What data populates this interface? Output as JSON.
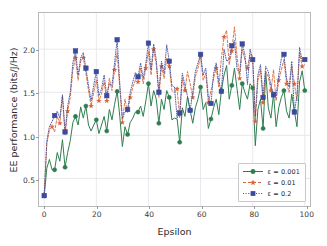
{
  "chart_data": {
    "type": "line",
    "title": "",
    "xlabel": "Epsilon",
    "ylabel": "EE performance (bits/J/Hz)",
    "xlim": [
      -2,
      102
    ],
    "ylim": [
      0.18,
      2.42
    ],
    "xticks": [
      0,
      20,
      40,
      60,
      80,
      100
    ],
    "yticks": [
      0.5,
      1.0,
      1.5,
      2.0
    ],
    "xticklabels": [
      "0",
      "20",
      "40",
      "60",
      "80",
      "100"
    ],
    "yticklabels": [
      "0.5",
      "1.0",
      "1.5",
      "2.0"
    ],
    "grid": true,
    "legend_position": "lower right",
    "x": [
      0,
      1,
      2,
      3,
      4,
      5,
      6,
      7,
      8,
      9,
      10,
      11,
      12,
      13,
      14,
      15,
      16,
      17,
      18,
      19,
      20,
      21,
      22,
      23,
      24,
      25,
      26,
      27,
      28,
      29,
      30,
      31,
      32,
      33,
      34,
      35,
      36,
      37,
      38,
      39,
      40,
      41,
      42,
      43,
      44,
      45,
      46,
      47,
      48,
      49,
      50,
      51,
      52,
      53,
      54,
      55,
      56,
      57,
      58,
      59,
      60,
      61,
      62,
      63,
      64,
      65,
      66,
      67,
      68,
      69,
      70,
      71,
      72,
      73,
      74,
      75,
      76,
      77,
      78,
      79,
      80,
      81,
      82,
      83,
      84,
      85,
      86,
      87,
      88,
      89,
      90,
      91,
      92,
      93,
      94,
      95,
      96,
      97,
      98,
      99,
      100
    ],
    "series": [
      {
        "name": "ε = 0.001",
        "color": "#2e7d4f",
        "linestyle": "solid",
        "marker": "circle",
        "marker_every": 4,
        "values": [
          0.3,
          0.62,
          0.72,
          0.6,
          0.6,
          0.8,
          0.7,
          0.95,
          0.63,
          0.8,
          0.94,
          1.15,
          1.22,
          1.12,
          1.33,
          1.2,
          1.34,
          1.12,
          1.05,
          1.12,
          1.18,
          1.02,
          1.12,
          1.22,
          1.05,
          1.3,
          1.18,
          1.36,
          1.51,
          1.22,
          0.87,
          1.1,
          1.01,
          1.15,
          1.2,
          1.27,
          1.27,
          1.34,
          1.22,
          1.4,
          1.6,
          1.34,
          1.52,
          1.42,
          1.14,
          1.42,
          1.3,
          1.52,
          1.44,
          1.18,
          1.2,
          1.19,
          0.92,
          1.32,
          1.22,
          1.45,
          1.29,
          1.14,
          1.32,
          1.42,
          1.56,
          1.3,
          1.38,
          1.08,
          1.19,
          1.32,
          1.42,
          1.24,
          1.52,
          1.7,
          1.81,
          1.42,
          1.58,
          1.78,
          1.54,
          1.3,
          1.6,
          1.5,
          1.42,
          1.6,
          1.55,
          0.88,
          1.3,
          1.42,
          1.08,
          1.74,
          1.32,
          1.2,
          1.48,
          1.1,
          1.32,
          1.44,
          1.52,
          1.28,
          1.2,
          1.48,
          1.28,
          1.1,
          1.62,
          1.75,
          1.52
        ]
      },
      {
        "name": "ε = 0.01",
        "color": "#d9663a",
        "linestyle": "dashed",
        "marker": "star",
        "marker_every": 3,
        "values": [
          0.32,
          0.9,
          1.06,
          1.1,
          1.04,
          1.22,
          1.14,
          1.46,
          1.0,
          1.28,
          1.44,
          1.76,
          1.9,
          1.64,
          1.86,
          1.9,
          1.72,
          1.52,
          1.34,
          1.5,
          1.64,
          1.4,
          1.48,
          1.62,
          1.4,
          1.66,
          1.52,
          1.76,
          1.96,
          1.54,
          1.15,
          1.42,
          1.26,
          1.44,
          1.56,
          1.64,
          1.62,
          1.78,
          1.6,
          1.78,
          1.97,
          1.7,
          2.0,
          1.82,
          1.44,
          1.8,
          1.66,
          1.9,
          1.8,
          1.52,
          1.5,
          1.54,
          1.2,
          1.66,
          1.52,
          1.74,
          1.6,
          1.44,
          1.68,
          1.78,
          1.92,
          1.64,
          1.72,
          1.38,
          1.52,
          1.66,
          1.78,
          1.56,
          1.9,
          2.14,
          2.22,
          1.82,
          1.98,
          2.26,
          1.92,
          1.66,
          2.0,
          1.88,
          1.78,
          1.94,
          1.92,
          1.16,
          1.64,
          1.76,
          1.38,
          1.74,
          1.68,
          1.52,
          1.76,
          1.4,
          1.64,
          1.76,
          1.88,
          1.6,
          1.5,
          1.8,
          1.6,
          1.4,
          1.96,
          1.8,
          1.82
        ]
      },
      {
        "name": "ε = 0.2",
        "color": "#3b4a9c",
        "linestyle": "dotted",
        "marker": "square",
        "marker_every": 4,
        "values": [
          0.3,
          0.94,
          1.1,
          1.16,
          1.23,
          1.28,
          1.2,
          1.47,
          1.04,
          1.34,
          1.5,
          1.84,
          1.98,
          1.7,
          1.9,
          1.96,
          1.78,
          1.58,
          1.4,
          1.58,
          1.74,
          1.46,
          1.54,
          1.7,
          1.46,
          1.6,
          1.58,
          1.84,
          2.11,
          1.6,
          1.2,
          1.27,
          1.3,
          1.5,
          1.62,
          1.73,
          1.68,
          1.84,
          1.66,
          1.84,
          2.07,
          1.76,
          2.06,
          1.88,
          1.5,
          1.86,
          1.72,
          2.05,
          1.86,
          1.58,
          1.56,
          1.2,
          1.26,
          1.72,
          1.58,
          1.45,
          1.29,
          1.5,
          1.74,
          1.84,
          1.94,
          1.7,
          1.78,
          1.44,
          1.37,
          1.72,
          1.84,
          1.62,
          1.51,
          2.0,
          1.86,
          1.88,
          2.04,
          2.1,
          1.77,
          1.72,
          2.06,
          1.94,
          1.59,
          2.0,
          1.88,
          1.22,
          1.7,
          1.82,
          1.44,
          1.8,
          1.74,
          1.58,
          1.47,
          1.46,
          1.7,
          1.89,
          1.94,
          1.66,
          1.56,
          1.86,
          1.27,
          1.46,
          2.02,
          1.86,
          1.88
        ]
      }
    ]
  },
  "legend": {
    "items": [
      {
        "label": "ε = 0.001"
      },
      {
        "label": "ε = 0.01"
      },
      {
        "label": "ε = 0.2"
      }
    ]
  },
  "colors": {
    "green": "#2e7d4f",
    "orange": "#d9663a",
    "blue": "#3b4a9c",
    "grid": "#e3e3e8",
    "frame": "#b9b9bd",
    "background": "#ffffff"
  }
}
